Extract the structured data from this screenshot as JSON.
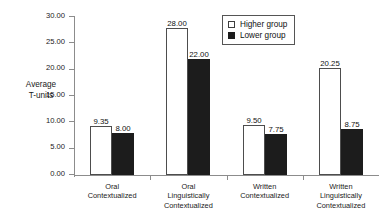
{
  "chart_data": {
    "type": "bar",
    "title": "",
    "subtitle": "",
    "xlabel": "",
    "ylabel": "Average\nT-units",
    "ylim": [
      0,
      30
    ],
    "ytick_step": 5,
    "ytick_labels": [
      "0.00",
      "5.00",
      "10.00",
      "15.00",
      "20.00",
      "25.00",
      "30.00"
    ],
    "ytick_values": [
      0,
      5,
      10,
      15,
      20,
      25,
      30
    ],
    "grid": false,
    "legend_position": "top-right",
    "categories": [
      "Oral\nContextualized",
      "Oral\nLinguistically\nContextualized",
      "Written\nContextualized",
      "Written\nLinguistically\nContextualized"
    ],
    "series": [
      {
        "name": "Higher group",
        "color": "#ffffff",
        "edge_color": "#4d4d4d",
        "values": [
          9.35,
          28.0,
          9.5,
          20.25
        ],
        "value_labels": [
          "9.35",
          "28.00",
          "9.50",
          "20.25"
        ]
      },
      {
        "name": "Lower group",
        "color": "#1c1c1c",
        "edge_color": "#1c1c1c",
        "values": [
          8.0,
          22.0,
          7.75,
          8.75
        ],
        "value_labels": [
          "8.00",
          "22.00",
          "7.75",
          "8.75"
        ]
      }
    ]
  },
  "legend": {
    "entries": [
      {
        "label": "Higher group",
        "swatch": "higher"
      },
      {
        "label": "Lower group",
        "swatch": "lower"
      }
    ]
  }
}
